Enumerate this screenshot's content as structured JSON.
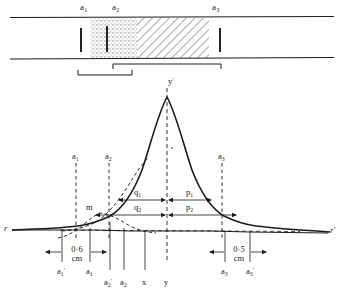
{
  "figure": {
    "type": "scientific-diagram",
    "colors": {
      "ink": "#1a1a1a",
      "stipple": "#9a9a9a",
      "hatch": "#8e8e8e",
      "background": "#ffffff"
    }
  },
  "top_diagram": {
    "labels": [
      {
        "id": "a1",
        "base": "a",
        "sub": "1",
        "prime": "",
        "x": 84,
        "y": 4
      },
      {
        "id": "a2",
        "base": "a",
        "sub": "2",
        "prime": "",
        "x": 116,
        "y": 4
      },
      {
        "id": "a3",
        "base": "a",
        "sub": "3",
        "prime": "",
        "x": 216,
        "y": 4
      }
    ],
    "tube_walls": {
      "top_y": 17,
      "bottom_y": 58
    },
    "stipple_zone": {
      "x_start": 90,
      "x_end": 137
    },
    "hatch_zone": {
      "x_start": 137,
      "x_end": 209
    },
    "partitions": [
      {
        "id": "partition-left",
        "x": 81
      },
      {
        "id": "partition-mid",
        "x": 107
      },
      {
        "id": "partition-right",
        "x": 220
      }
    ],
    "brackets": [
      {
        "id": "bracket-upper",
        "x_start": 113,
        "x_end": 221,
        "y": 64
      },
      {
        "id": "bracket-lower",
        "x_start": 78,
        "x_end": 132,
        "y": 75
      }
    ]
  },
  "curve_plot": {
    "peak_label": {
      "base": "y",
      "prime": "'",
      "x": 172,
      "y": 78
    },
    "minor_label": {
      "text": "m",
      "x": 88,
      "y": 207
    },
    "vertical_markers": [
      {
        "id": "a1",
        "base": "a",
        "sub": "1",
        "prime": "",
        "x": 76,
        "y_label": 155,
        "y_top": 163,
        "y_bottom": 238
      },
      {
        "id": "a2",
        "base": "a",
        "sub": "2",
        "prime": "",
        "x": 109,
        "y_label": 155,
        "y_top": 163,
        "y_bottom": 238
      },
      {
        "id": "a3",
        "base": "a",
        "sub": "3",
        "prime": "",
        "x": 222,
        "y_label": 155,
        "y_top": 163,
        "y_bottom": 238
      },
      {
        "id": "y-center",
        "base": "y",
        "sub": "",
        "prime": "",
        "x": 167,
        "y_top": 88,
        "y_bottom": 262
      }
    ],
    "interval_labels": [
      {
        "id": "q1",
        "base": "q",
        "sub": "1",
        "x": 137,
        "y": 193,
        "from": 118,
        "to": 167,
        "row": 1
      },
      {
        "id": "p1",
        "base": "p",
        "sub": "1",
        "x": 189,
        "y": 193,
        "from": 167,
        "to": 212,
        "row": 1
      },
      {
        "id": "q2",
        "base": "q",
        "sub": "2",
        "x": 137,
        "y": 208,
        "from": 95,
        "to": 167,
        "row": 2
      },
      {
        "id": "p2",
        "base": "p",
        "sub": "2",
        "x": 189,
        "y": 208,
        "from": 167,
        "to": 237,
        "row": 2
      }
    ],
    "baseline_y": 231,
    "baseline_left_label": {
      "text": "r",
      "x": 5,
      "y": 227
    },
    "baseline_right_label": {
      "text": "r'",
      "x": 330,
      "y": 229
    }
  },
  "bottom_axis": {
    "ticks": [
      {
        "id": "a1p",
        "base": "a",
        "sub": "1",
        "prime": "'",
        "x": 62,
        "label_y": 271
      },
      {
        "id": "a1",
        "base": "a",
        "sub": "1",
        "prime": "",
        "x": 90,
        "label_y": 271
      },
      {
        "id": "a2p",
        "base": "a",
        "sub": "2",
        "prime": "'",
        "x": 110,
        "label_y": 282
      },
      {
        "id": "a2",
        "base": "a",
        "sub": "2",
        "prime": "",
        "x": 124,
        "label_y": 282
      },
      {
        "id": "x",
        "base": "x",
        "sub": "",
        "prime": "",
        "x": 145,
        "label_y": 282
      },
      {
        "id": "y",
        "base": "y",
        "sub": "",
        "prime": "",
        "x": 167,
        "label_y": 282
      },
      {
        "id": "a3",
        "base": "a",
        "sub": "3",
        "prime": "",
        "x": 225,
        "label_y": 271
      },
      {
        "id": "a3p",
        "base": "a",
        "sub": "3",
        "prime": "'",
        "x": 250,
        "label_y": 271
      }
    ],
    "measurements": [
      {
        "id": "left-measure",
        "value": "0·6",
        "unit": "cm",
        "x_start": 62,
        "x_end": 90,
        "y": 255
      },
      {
        "id": "right-measure",
        "value": "0·5",
        "unit": "cm",
        "x_start": 225,
        "x_end": 250,
        "y": 255
      }
    ]
  }
}
